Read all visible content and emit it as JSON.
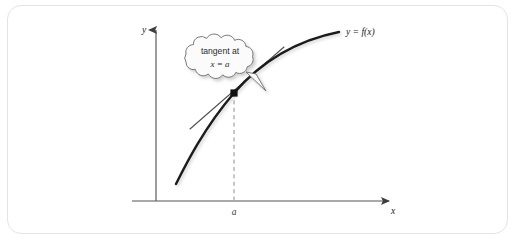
{
  "figure": {
    "panel_border_color": "#e4e4e4",
    "background_color": "#ffffff",
    "axes": {
      "y_axis_label": "y",
      "x_axis_label": "x",
      "axis_color": "#555555"
    },
    "curve": {
      "label": "y = f(x)",
      "color": "#1a1a1a"
    },
    "tangent_line": {
      "color": "#555555"
    },
    "tangent_point": {
      "color": "#111111",
      "x_tick_label": "a"
    },
    "dashed_guide": {
      "color": "#8a8a8a"
    },
    "callout": {
      "line_1": "tangent at",
      "line_2": "x = a",
      "fill": "#fbfbfb",
      "stroke": "#6b6b6b"
    }
  }
}
